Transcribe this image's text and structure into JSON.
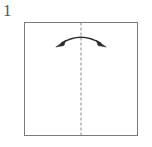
{
  "figure": {
    "type": "origami-instruction-step",
    "step_number": "1",
    "canvas": {
      "width": 152,
      "height": 147,
      "background": "#ffffff"
    },
    "paper": {
      "shape": "square",
      "label": "square sheet of paper",
      "x": 24,
      "y": 22,
      "width": 114,
      "height": 114,
      "stroke_color": "#7a7a7a",
      "fill_color": "#ffffff",
      "stroke_width": 1
    },
    "fold_line": {
      "label": "vertical valley fold line",
      "style": "dashed",
      "orientation": "vertical",
      "x": 81,
      "y_start": 22,
      "y_end": 136,
      "stroke_color": "#8a8a8a",
      "dash_length": 3,
      "dash_gap": 2,
      "stroke_width": 1
    },
    "arrow": {
      "label": "double-headed curved fold arrow",
      "type": "arc-double-head",
      "direction": "bidirectional-horizontal",
      "x_start": 60,
      "x_end": 102,
      "apex_y": 35,
      "end_y": 45,
      "stroke_color": "#2b2b2b",
      "stroke_width": 1.6
    }
  }
}
